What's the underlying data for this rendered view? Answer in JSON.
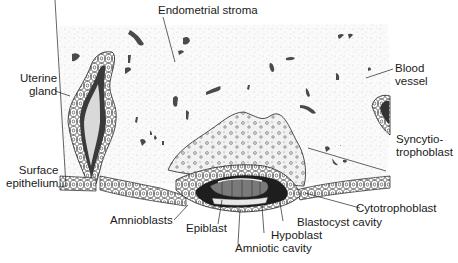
{
  "diagram": {
    "labels": {
      "endometrial_stroma": "Endometrial stroma",
      "uterine_gland": [
        "Uterine",
        "gland"
      ],
      "blood_vessel": [
        "Blood",
        "vessel"
      ],
      "syncytiotrophoblast": [
        "Syncytio-",
        "trophoblast"
      ],
      "surface_epithelium": [
        "Surface",
        "epithelium"
      ],
      "cytotrophoblast": "Cytotrophoblast",
      "amnioblasts": "Amnioblasts",
      "epiblast": "Epiblast",
      "blastocyst_cavity": "Blastocyst cavity",
      "hypoblast": "Hypoblast",
      "amniotic_cavity": "Amniotic cavity"
    },
    "colors": {
      "stroma_speckle": "#d8d8d8",
      "blood_vessel": "#4a4a4a",
      "ink": "#1a1a1a",
      "embryo_dark": "#2a2a2a",
      "epiblast_gray": "#7a7a7a"
    }
  }
}
